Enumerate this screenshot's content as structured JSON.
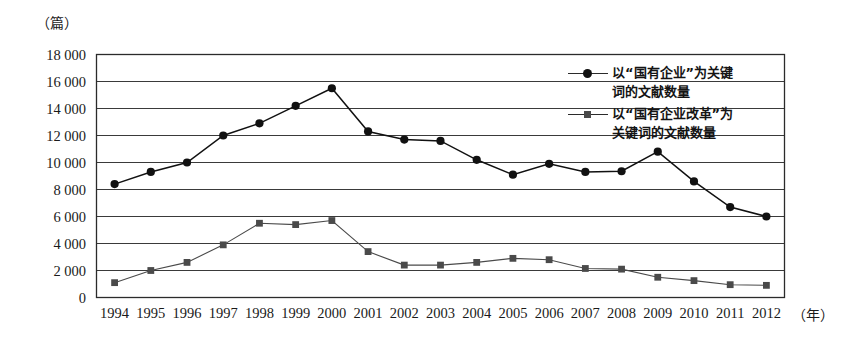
{
  "chart_data": {
    "type": "line",
    "title": "",
    "xlabel": "（年）",
    "ylabel": "（篇）",
    "x": [
      1994,
      1995,
      1996,
      1997,
      1998,
      1999,
      2000,
      2001,
      2002,
      2003,
      2004,
      2005,
      2006,
      2007,
      2008,
      2009,
      2010,
      2011,
      2012
    ],
    "categories": [
      "1994",
      "1995",
      "1996",
      "1997",
      "1998",
      "1999",
      "2000",
      "2001",
      "2002",
      "2003",
      "2004",
      "2005",
      "2006",
      "2007",
      "2008",
      "2009",
      "2010",
      "2011",
      "2012"
    ],
    "ylim": [
      0,
      18000
    ],
    "ytick_values": [
      0,
      2000,
      4000,
      6000,
      8000,
      10000,
      12000,
      14000,
      16000,
      18000
    ],
    "ytick_labels": [
      "0",
      "2 000",
      "4 000",
      "6 000",
      "8 000",
      "10 000",
      "12 000",
      "14 000",
      "16 000",
      "18 000"
    ],
    "grid": true,
    "grid_axis": "y",
    "legend_position": "top-right-inside",
    "series": [
      {
        "name": "以“国有企业”为关键词的文献数量",
        "marker": "circle",
        "color": "#111111",
        "values": [
          8400,
          9300,
          10000,
          12000,
          12900,
          14200,
          15500,
          12300,
          11700,
          11600,
          10200,
          9100,
          9900,
          9300,
          9350,
          10800,
          8600,
          6700,
          6000
        ]
      },
      {
        "name": "以“国有企业改革”为关键词的文献数量",
        "marker": "square",
        "color": "#4a4a4a",
        "values": [
          1100,
          2000,
          2600,
          3900,
          5500,
          5400,
          5700,
          3400,
          2400,
          2400,
          2600,
          2900,
          2800,
          2150,
          2100,
          1500,
          1250,
          950,
          900
        ]
      }
    ]
  },
  "legend": {
    "items": [
      {
        "label_line1": "以“国有企业”为关键",
        "label_line2": "词的文献数量"
      },
      {
        "label_line1": "以“国有企业改革”为",
        "label_line2": "关键词的文献数量"
      }
    ]
  },
  "axes": {
    "y_unit": "（篇）",
    "x_unit": "（年）"
  }
}
